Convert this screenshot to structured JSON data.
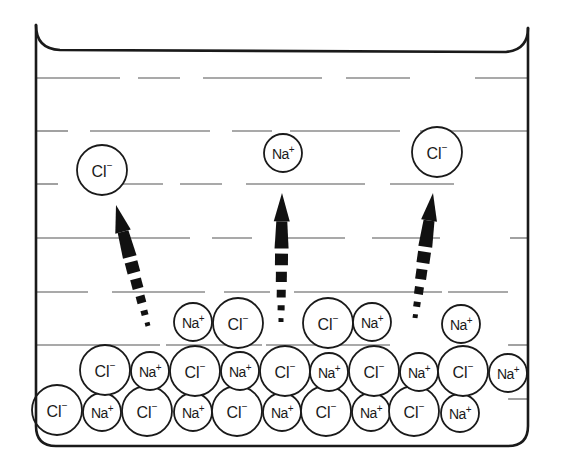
{
  "diagram": {
    "colors": {
      "stroke": "#1a1a1a",
      "water_line": "#555555",
      "background": "#ffffff"
    },
    "beaker": {
      "left": 36,
      "right": 528,
      "top_left": 25,
      "top_right": 28,
      "bottom": 446,
      "corner_radius": 20
    },
    "water_lines": [
      {
        "y": 78,
        "segments": [
          [
            36,
            120
          ],
          [
            138,
            180
          ],
          [
            203,
            322
          ],
          [
            346,
            410
          ],
          [
            475,
            528
          ]
        ]
      },
      {
        "y": 131,
        "segments": [
          [
            36,
            68
          ],
          [
            90,
            210
          ],
          [
            232,
            272
          ],
          [
            290,
            400
          ],
          [
            420,
            540
          ]
        ]
      },
      {
        "y": 184,
        "segments": [
          [
            36,
            58
          ],
          [
            120,
            163
          ],
          [
            180,
            222
          ],
          [
            246,
            365
          ],
          [
            390,
            454
          ]
        ]
      },
      {
        "y": 238,
        "segments": [
          [
            36,
            190
          ],
          [
            212,
            252
          ],
          [
            286,
            345
          ],
          [
            372,
            440
          ],
          [
            510,
            528
          ]
        ]
      },
      {
        "y": 292,
        "segments": [
          [
            36,
            88
          ],
          [
            112,
            205
          ],
          [
            224,
            270
          ],
          [
            294,
            442
          ],
          [
            448,
            508
          ]
        ]
      },
      {
        "y": 345,
        "segments": [
          [
            36,
            160
          ],
          [
            166,
            262
          ],
          [
            266,
            390
          ],
          [
            508,
            528
          ]
        ]
      },
      {
        "y": 399,
        "segments": [
          [
            508,
            528
          ]
        ]
      }
    ],
    "ions": {
      "dissolved": [
        {
          "type": "Cl",
          "label": "Cl",
          "charge": "-",
          "x": 102,
          "y": 170
        },
        {
          "type": "Na",
          "label": "Na",
          "charge": "+",
          "x": 283,
          "y": 153
        },
        {
          "type": "Cl",
          "label": "Cl",
          "charge": "-",
          "x": 437,
          "y": 152
        }
      ],
      "crystal_top_row": [
        {
          "type": "Na",
          "label": "Na",
          "charge": "+",
          "x": 193,
          "y": 322
        },
        {
          "type": "Cl",
          "label": "Cl",
          "charge": "-",
          "x": 238,
          "y": 323
        },
        {
          "type": "Cl",
          "label": "Cl",
          "charge": "-",
          "x": 328,
          "y": 323
        },
        {
          "type": "Na",
          "label": "Na",
          "charge": "+",
          "x": 372,
          "y": 322
        },
        {
          "type": "Na",
          "label": "Na",
          "charge": "+",
          "x": 461,
          "y": 324
        }
      ],
      "crystal_middle_row": [
        {
          "type": "Cl",
          "label": "Cl",
          "charge": "-",
          "x": 105,
          "y": 370
        },
        {
          "type": "Na",
          "label": "Na",
          "charge": "+",
          "x": 150,
          "y": 371
        },
        {
          "type": "Cl",
          "label": "Cl",
          "charge": "-",
          "x": 195,
          "y": 371
        },
        {
          "type": "Na",
          "label": "Na",
          "charge": "+",
          "x": 240,
          "y": 371
        },
        {
          "type": "Cl",
          "label": "Cl",
          "charge": "-",
          "x": 285,
          "y": 371
        },
        {
          "type": "Na",
          "label": "Na",
          "charge": "+",
          "x": 329,
          "y": 372
        },
        {
          "type": "Cl",
          "label": "Cl",
          "charge": "-",
          "x": 374,
          "y": 371
        },
        {
          "type": "Na",
          "label": "Na",
          "charge": "+",
          "x": 419,
          "y": 372
        },
        {
          "type": "Cl",
          "label": "Cl",
          "charge": "-",
          "x": 463,
          "y": 371
        },
        {
          "type": "Na",
          "label": "Na",
          "charge": "+",
          "x": 508,
          "y": 373
        }
      ],
      "crystal_bottom_row": [
        {
          "type": "Cl",
          "label": "Cl",
          "charge": "-",
          "x": 57,
          "y": 410
        },
        {
          "type": "Na",
          "label": "Na",
          "charge": "+",
          "x": 102,
          "y": 412
        },
        {
          "type": "Cl",
          "label": "Cl",
          "charge": "-",
          "x": 147,
          "y": 411
        },
        {
          "type": "Na",
          "label": "Na",
          "charge": "+",
          "x": 193,
          "y": 412
        },
        {
          "type": "Cl",
          "label": "Cl",
          "charge": "-",
          "x": 237,
          "y": 411
        },
        {
          "type": "Na",
          "label": "Na",
          "charge": "+",
          "x": 282,
          "y": 412
        },
        {
          "type": "Cl",
          "label": "Cl",
          "charge": "-",
          "x": 326,
          "y": 411
        },
        {
          "type": "Na",
          "label": "Na",
          "charge": "+",
          "x": 371,
          "y": 412
        },
        {
          "type": "Cl",
          "label": "Cl",
          "charge": "-",
          "x": 414,
          "y": 411
        },
        {
          "type": "Na",
          "label": "Na",
          "charge": "+",
          "x": 460,
          "y": 413
        }
      ]
    },
    "ion_radius": {
      "Cl": 25,
      "Na": 19
    },
    "arrows": [
      {
        "name": "arrow-cl-left",
        "from": [
          148,
          326
        ],
        "to": [
          116,
          205
        ]
      },
      {
        "name": "arrow-na-center",
        "from": [
          281,
          322
        ],
        "to": [
          282,
          193
        ]
      },
      {
        "name": "arrow-cl-right",
        "from": [
          415,
          318
        ],
        "to": [
          433,
          193
        ]
      }
    ]
  }
}
